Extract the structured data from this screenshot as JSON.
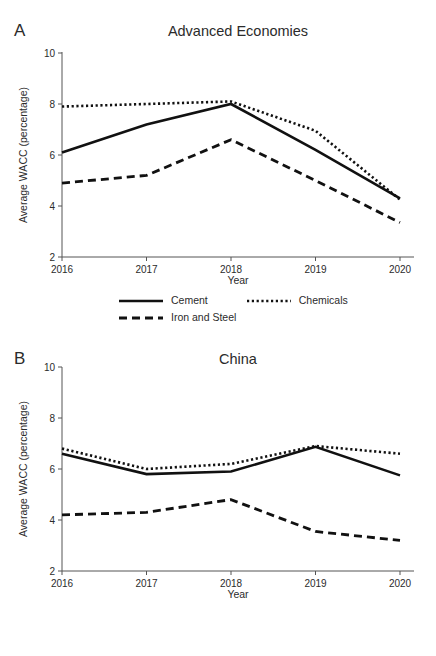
{
  "figure": {
    "y_axis_label": "Average WACC (percentage)",
    "x_axis_label": "Year",
    "y_ticks": [
      "2",
      "4",
      "6",
      "8",
      "10"
    ],
    "x_ticks": [
      "2016",
      "2017",
      "2018",
      "2019",
      "2020"
    ],
    "legend": {
      "cement": "Cement",
      "chemicals": "Chemicals",
      "iron_and_steel": "Iron and Steel"
    }
  },
  "panel_a": {
    "letter": "A",
    "title": "Advanced Economies"
  },
  "panel_b": {
    "letter": "B",
    "title": "China"
  },
  "chart_data": [
    {
      "type": "line",
      "panel": "A",
      "title": "Advanced Economies",
      "xlabel": "Year",
      "ylabel": "Average WACC (percentage)",
      "x": [
        "2016",
        "2017",
        "2018",
        "2019",
        "2020"
      ],
      "categories": [
        "2016",
        "2017",
        "2018",
        "2019",
        "2020"
      ],
      "ylim": [
        2,
        10
      ],
      "yticks": [
        2,
        4,
        6,
        8,
        10
      ],
      "grid": false,
      "legend_position": "bottom",
      "series": [
        {
          "name": "Cement",
          "style": "solid",
          "values": [
            6.1,
            7.2,
            8.0,
            6.2,
            4.3
          ]
        },
        {
          "name": "Chemicals",
          "style": "dotted",
          "values": [
            7.9,
            8.0,
            8.1,
            6.95,
            4.25
          ]
        },
        {
          "name": "Iron and Steel",
          "style": "dashed",
          "values": [
            4.9,
            5.2,
            6.6,
            5.0,
            3.35
          ]
        }
      ]
    },
    {
      "type": "line",
      "panel": "B",
      "title": "China",
      "xlabel": "Year",
      "ylabel": "Average WACC (percentage)",
      "x": [
        "2016",
        "2017",
        "2018",
        "2019",
        "2020"
      ],
      "categories": [
        "2016",
        "2017",
        "2018",
        "2019",
        "2020"
      ],
      "ylim": [
        2,
        10
      ],
      "yticks": [
        2,
        4,
        6,
        8,
        10
      ],
      "grid": false,
      "legend_position": "bottom",
      "series": [
        {
          "name": "Cement",
          "style": "solid",
          "values": [
            6.6,
            5.8,
            5.9,
            6.87,
            5.75
          ]
        },
        {
          "name": "Chemicals",
          "style": "dotted",
          "values": [
            6.8,
            6.0,
            6.2,
            6.9,
            6.6
          ]
        },
        {
          "name": "Iron and Steel",
          "style": "dashed",
          "values": [
            4.2,
            4.3,
            4.8,
            3.55,
            3.2
          ]
        }
      ]
    }
  ]
}
